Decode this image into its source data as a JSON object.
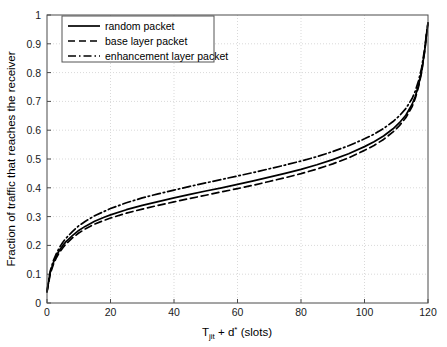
{
  "chart_data": {
    "type": "line",
    "title": "",
    "xlabel": "T_jit + d* (slots)",
    "xlabel_parts": {
      "base1": "T",
      "sub1": "jit",
      "mid": " + ",
      "base2": "d",
      "sup2": "*",
      "tail": " (slots)"
    },
    "ylabel": "Fraction of traffic that reaches the receiver",
    "xlim": [
      0,
      120
    ],
    "ylim": [
      0,
      1
    ],
    "xticks": [
      0,
      20,
      40,
      60,
      80,
      100,
      120
    ],
    "xtick_labels": [
      "0",
      "20",
      "40",
      "60",
      "80",
      "100",
      "120"
    ],
    "yticks": [
      0,
      0.1,
      0.2,
      0.3,
      0.4,
      0.5,
      0.6,
      0.7,
      0.8,
      0.9,
      1
    ],
    "ytick_labels": [
      "0",
      "0.1",
      "0.2",
      "0.3",
      "0.4",
      "0.5",
      "0.6",
      "0.7",
      "0.8",
      "0.9",
      "1"
    ],
    "grid": true,
    "grid_style": "dotted",
    "grid_color": "#d9d9d9",
    "legend_position": "top-left",
    "x": [
      0,
      1,
      2,
      3,
      4,
      5,
      6,
      8,
      10,
      12,
      15,
      18,
      20,
      25,
      30,
      35,
      40,
      45,
      50,
      55,
      60,
      65,
      70,
      75,
      80,
      85,
      90,
      95,
      100,
      103,
      106,
      109,
      111,
      113,
      115,
      116,
      117,
      118,
      119,
      119.5,
      120
    ],
    "series": [
      {
        "name": "random packet",
        "style": "solid",
        "color": "#000000",
        "values": [
          0.04,
          0.105,
          0.14,
          0.165,
          0.185,
          0.2,
          0.213,
          0.234,
          0.252,
          0.266,
          0.284,
          0.298,
          0.306,
          0.324,
          0.339,
          0.352,
          0.365,
          0.377,
          0.389,
          0.4,
          0.412,
          0.424,
          0.437,
          0.45,
          0.464,
          0.48,
          0.498,
          0.518,
          0.543,
          0.56,
          0.58,
          0.605,
          0.626,
          0.652,
          0.69,
          0.718,
          0.755,
          0.805,
          0.88,
          0.93,
          0.972
        ]
      },
      {
        "name": "base layer packet",
        "style": "dashed",
        "color": "#000000",
        "values": [
          0.038,
          0.1,
          0.134,
          0.158,
          0.177,
          0.192,
          0.205,
          0.226,
          0.243,
          0.257,
          0.274,
          0.287,
          0.295,
          0.312,
          0.326,
          0.339,
          0.351,
          0.363,
          0.374,
          0.386,
          0.397,
          0.409,
          0.422,
          0.435,
          0.449,
          0.465,
          0.483,
          0.504,
          0.53,
          0.547,
          0.568,
          0.594,
          0.616,
          0.643,
          0.682,
          0.711,
          0.75,
          0.801,
          0.877,
          0.928,
          0.971
        ]
      },
      {
        "name": "enhancement layer packet",
        "style": "dashdot",
        "color": "#000000",
        "values": [
          0.042,
          0.11,
          0.147,
          0.173,
          0.194,
          0.211,
          0.225,
          0.248,
          0.268,
          0.283,
          0.303,
          0.318,
          0.328,
          0.348,
          0.365,
          0.379,
          0.392,
          0.405,
          0.417,
          0.429,
          0.441,
          0.453,
          0.466,
          0.479,
          0.493,
          0.508,
          0.526,
          0.546,
          0.57,
          0.586,
          0.606,
          0.63,
          0.65,
          0.675,
          0.71,
          0.736,
          0.771,
          0.817,
          0.886,
          0.933,
          0.973
        ]
      }
    ],
    "legend": [
      {
        "label": "random packet",
        "style": "solid"
      },
      {
        "label": "base layer packet",
        "style": "dashed"
      },
      {
        "label": "enhancement layer packet",
        "style": "dashdot"
      }
    ]
  }
}
